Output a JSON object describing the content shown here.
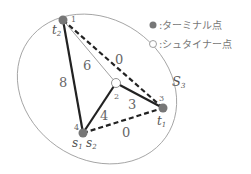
{
  "diagram": {
    "region_label": {
      "main": "S",
      "sub": "3"
    },
    "legend": {
      "terminal": {
        "icon": "filled-circle",
        "label": ":ターミナル点"
      },
      "steiner": {
        "icon": "hollow-circle",
        "label": ":シュタイナー点"
      }
    },
    "nodes": [
      {
        "id": "1",
        "type": "terminal",
        "name": "t",
        "sub": "2"
      },
      {
        "id": "2",
        "type": "steiner",
        "name": "",
        "sub": ""
      },
      {
        "id": "3",
        "type": "terminal",
        "name": "t",
        "sub": "1"
      },
      {
        "id": "4",
        "type": "terminal",
        "name": "s",
        "sub": "1",
        "name2": "s",
        "sub2": "2"
      }
    ],
    "edges": [
      {
        "from": "1",
        "to": "4",
        "weight": "8",
        "style": "thick-solid"
      },
      {
        "from": "1",
        "to": "2",
        "weight": "6",
        "style": "thin-solid"
      },
      {
        "from": "1",
        "to": "3",
        "weight": "0",
        "style": "dashed"
      },
      {
        "from": "2",
        "to": "4",
        "weight": "4",
        "style": "thick-solid"
      },
      {
        "from": "2",
        "to": "3",
        "weight": "3",
        "style": "thick-solid"
      },
      {
        "from": "4",
        "to": "3",
        "weight": "0",
        "style": "dashed"
      }
    ]
  }
}
